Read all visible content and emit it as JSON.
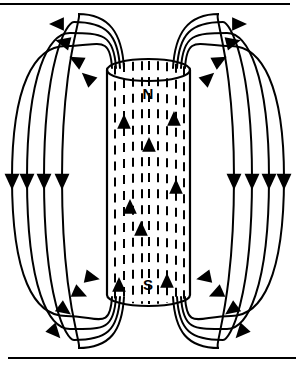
{
  "figure": {
    "type": "physics-diagram",
    "width": 296,
    "height": 368,
    "background_color": "#ffffff",
    "line_color": "#000000"
  },
  "frame": {
    "top_rule": {
      "y": 4,
      "x1": 0,
      "x2": 290,
      "thickness": 2
    },
    "bottom_rule": {
      "y": 358,
      "x1": 8,
      "x2": 296,
      "thickness": 2
    }
  },
  "magnet": {
    "shape": "cylinder",
    "left": 107,
    "right": 190,
    "top": 70,
    "bottom": 295,
    "ellipse_ry": 11,
    "north_label": "N",
    "south_label": "S",
    "north_label_x": 148,
    "north_label_y": 99,
    "south_label_x": 148,
    "south_label_y": 290,
    "interior_field_direction": "upward",
    "interior_line_style": "dashed",
    "interior_line_xs": [
      115,
      124,
      133,
      142,
      149,
      158,
      167,
      176,
      184
    ],
    "interior_arrows": [
      {
        "x": 124,
        "y": 125
      },
      {
        "x": 174,
        "y": 122
      },
      {
        "x": 149,
        "y": 148
      },
      {
        "x": 176,
        "y": 190
      },
      {
        "x": 130,
        "y": 210
      },
      {
        "x": 141,
        "y": 232
      },
      {
        "x": 119,
        "y": 288
      },
      {
        "x": 167,
        "y": 284
      }
    ]
  },
  "field_lines": {
    "description": "External magnetic field lines emerging from the north pole, arcing outward and downward, and re-entering at the south pole.",
    "direction": "north-to-south",
    "left_loops": [
      {
        "spread": 1,
        "exit_x": 112,
        "apex_y": 46,
        "far_x": 12,
        "return_x": 112
      },
      {
        "spread": 2,
        "exit_x": 116,
        "apex_y": 33,
        "far_x": 27,
        "return_x": 116
      },
      {
        "spread": 3,
        "exit_x": 120,
        "apex_y": 22,
        "far_x": 44,
        "return_x": 120
      },
      {
        "spread": 4,
        "exit_x": 124,
        "apex_y": 14,
        "far_x": 62,
        "return_x": 124
      }
    ],
    "right_loops": [
      {
        "spread": 1,
        "exit_x": 185,
        "apex_y": 46,
        "far_x": 284,
        "return_x": 185
      },
      {
        "spread": 2,
        "exit_x": 181,
        "apex_y": 33,
        "far_x": 269,
        "return_x": 181
      },
      {
        "spread": 3,
        "exit_x": 177,
        "apex_y": 22,
        "far_x": 252,
        "return_x": 177
      },
      {
        "spread": 4,
        "exit_x": 173,
        "apex_y": 14,
        "far_x": 234,
        "return_x": 173
      }
    ],
    "left_straight_arrow_xs": [
      12,
      27,
      44,
      62
    ],
    "right_straight_arrow_xs": [
      284,
      269,
      252,
      234
    ],
    "straight_arrow_y": 178,
    "top_left_arrow_points": [
      {
        "x": 60,
        "y": 24
      },
      {
        "x": 66,
        "y": 43
      },
      {
        "x": 79,
        "y": 62
      },
      {
        "x": 90,
        "y": 80
      }
    ],
    "top_right_arrow_points": [
      {
        "x": 236,
        "y": 24
      },
      {
        "x": 230,
        "y": 43
      },
      {
        "x": 217,
        "y": 62
      },
      {
        "x": 206,
        "y": 80
      }
    ],
    "bottom_left_arrow_points": [
      {
        "x": 53,
        "y": 330
      },
      {
        "x": 62,
        "y": 308
      },
      {
        "x": 77,
        "y": 292
      },
      {
        "x": 89,
        "y": 277
      }
    ],
    "bottom_right_arrow_points": [
      {
        "x": 243,
        "y": 330
      },
      {
        "x": 234,
        "y": 308
      },
      {
        "x": 219,
        "y": 292
      },
      {
        "x": 207,
        "y": 277
      }
    ]
  }
}
